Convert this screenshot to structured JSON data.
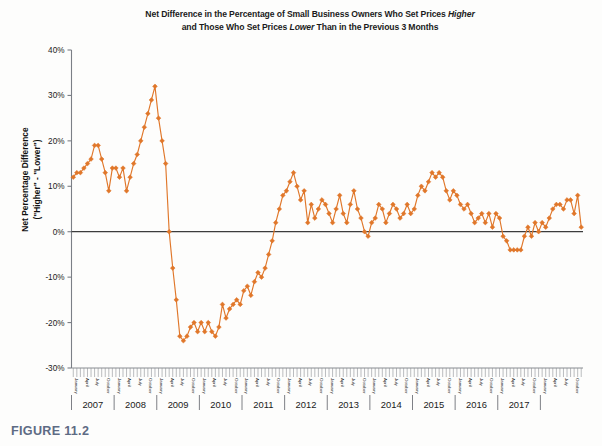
{
  "figure": {
    "caption": "FIGURE 11.2"
  },
  "chart_data": {
    "type": "line",
    "title_line1_pre": "Net Difference in the Percentage of Small Business Owners Who Set Prices ",
    "title_line1_ital": "Higher",
    "title_line2_pre": "and Those Who Set Prices ",
    "title_line2_ital": "Lower",
    "title_line2_post": " Than in the Previous 3 Months",
    "title": "Net Difference in the Percentage of Small Business Owners Who Set Prices Higher and Those Who Set Prices Lower Than in the Previous 3 Months",
    "xlabel": "",
    "ylabel_line1": "Net Percentage Difference",
    "ylabel_line2": "(\"Higher\" - \"Lower\")",
    "ylabel": "Net Percentage Difference (\"Higher\" - \"Lower\")",
    "ylim": [
      -30,
      40
    ],
    "ytick_labels": [
      "40%",
      "30%",
      "20%",
      "10%",
      "0%",
      "-10%",
      "-20%",
      "-30%"
    ],
    "ytick_values": [
      40,
      30,
      20,
      10,
      0,
      -10,
      -20,
      -30
    ],
    "grid": false,
    "legend": "none",
    "zero_line": true,
    "marker": "diamond",
    "line_color": "#E0772A",
    "marker_color": "#E0772A",
    "axis_color": "#7b7f86",
    "zero_line_color": "#3c3c3c",
    "years": [
      "2007",
      "2008",
      "2009",
      "2010",
      "2011",
      "2012",
      "2013",
      "2014",
      "2015",
      "2016",
      "2017"
    ],
    "month_tick_labels": [
      "January",
      "April",
      "July",
      "October"
    ],
    "x_start": "2007-01",
    "x_end": "2017-07",
    "series": [
      {
        "name": "Net percentage higher minus lower",
        "values": [
          12,
          13,
          13,
          14,
          15,
          16,
          19,
          19,
          16,
          13,
          9,
          14,
          14,
          12,
          14,
          9,
          12,
          15,
          17,
          20,
          23,
          26,
          29,
          32,
          25,
          20,
          15,
          0,
          -8,
          -15,
          -23,
          -24,
          -23,
          -21,
          -20,
          -22,
          -20,
          -22,
          -20,
          -22,
          -23,
          -21,
          -16,
          -19,
          -17,
          -16,
          -15,
          -16,
          -13,
          -12,
          -14,
          -11,
          -9,
          -10,
          -8,
          -5,
          -2,
          2,
          5,
          8,
          9,
          11,
          13,
          10,
          7,
          9,
          2,
          6,
          3,
          5,
          7,
          6,
          4,
          2,
          5,
          8,
          4,
          2,
          6,
          9,
          5,
          3,
          0,
          -1,
          2,
          3,
          6,
          5,
          2,
          4,
          6,
          5,
          3,
          4,
          6,
          4,
          5,
          8,
          10,
          9,
          11,
          13,
          12,
          13,
          12,
          9,
          7,
          9,
          8,
          6,
          5,
          6,
          4,
          2,
          3,
          4,
          2,
          4,
          1,
          4,
          3,
          -1,
          -2,
          -4,
          -4,
          -4,
          -4,
          -1,
          1,
          -1,
          2,
          0,
          2,
          1,
          3,
          5,
          6,
          6,
          5,
          7,
          7,
          4,
          8,
          1
        ]
      }
    ]
  }
}
